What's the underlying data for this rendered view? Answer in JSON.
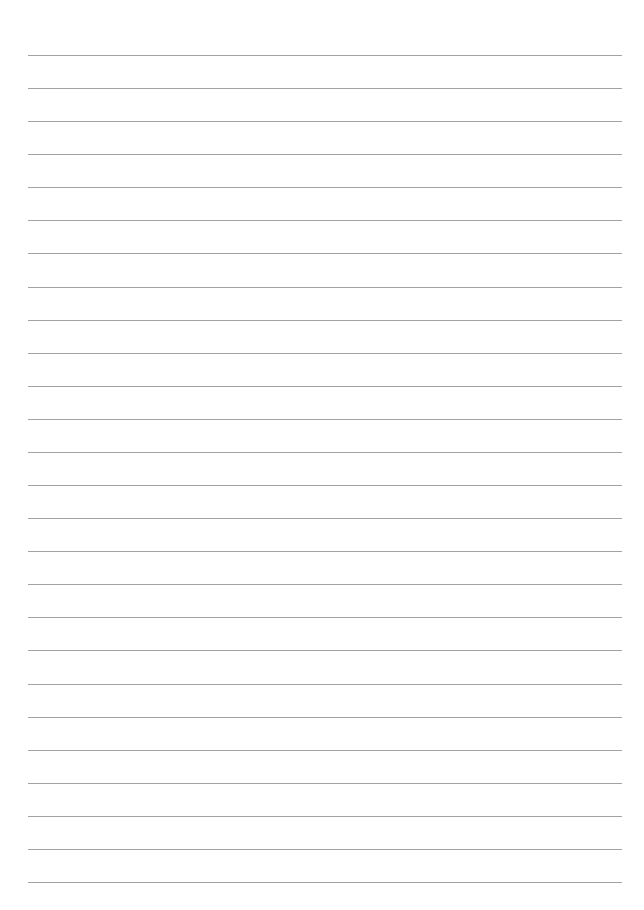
{
  "page": {
    "type": "lined-paper",
    "background": "#ffffff",
    "line_color": "#a3a3a3",
    "line_count": 26,
    "first_line_y": 55,
    "line_spacing": 33.08,
    "line_left": 28,
    "line_right": 622
  }
}
